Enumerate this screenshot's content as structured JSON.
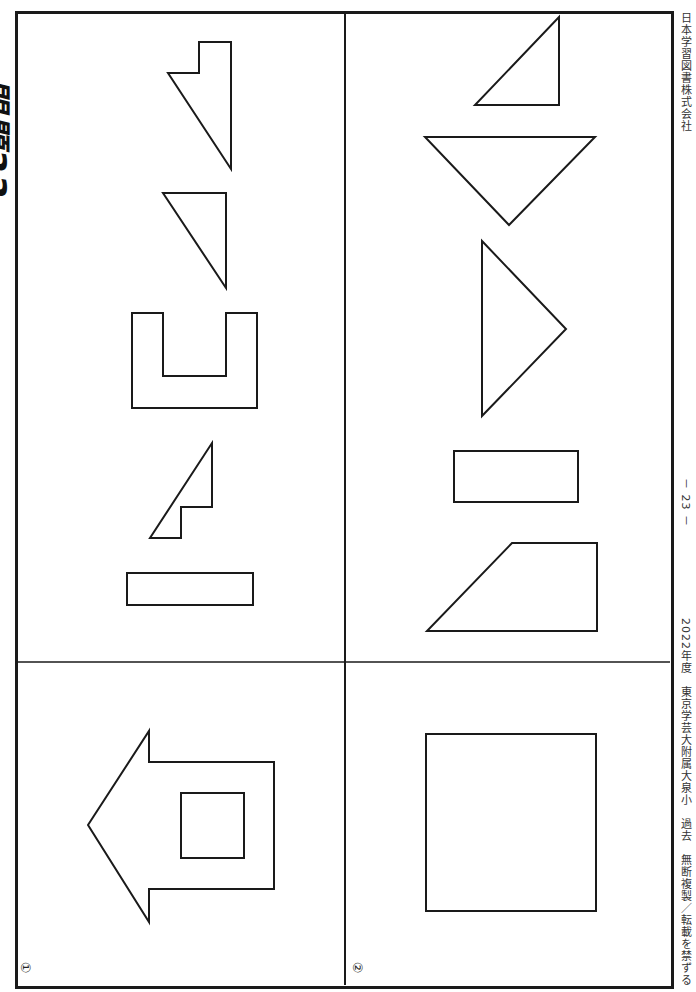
{
  "page": {
    "title": "問題33",
    "publisher": "日本学習図書株式会社",
    "page_number": "－ 23 －",
    "footer": "2022年度　東京学芸大附属大泉小　過去　無断複製／転載を禁ずる"
  },
  "panels": [
    {
      "label": "①",
      "name": "problem-1",
      "example_shape": "arrow-house with inner square",
      "option_shapes": [
        "notched right triangle",
        "right triangle",
        "U-shape",
        "small notched triangle",
        "thin rectangle"
      ]
    },
    {
      "label": "②",
      "name": "problem-2",
      "example_shape": "square",
      "option_shapes": [
        "right triangle",
        "inverted triangle",
        "pointing triangle",
        "rectangle",
        "trapezoid"
      ]
    }
  ],
  "colors": {
    "line": "#1a1a1a",
    "background": "#ffffff",
    "text": "#333333"
  }
}
